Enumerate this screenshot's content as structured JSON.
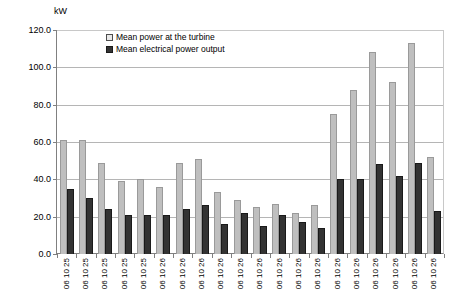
{
  "chart": {
    "y_unit_label": "kW",
    "legend": [
      {
        "label": "Mean power at the turbine",
        "swatch": "light",
        "color": "#BFBFBF"
      },
      {
        "label": "Mean electrical power output",
        "swatch": "dark",
        "color": "#333333"
      }
    ]
  },
  "chart_data": {
    "type": "bar",
    "title": "",
    "xlabel": "",
    "ylabel": "kW",
    "ylim": [
      0,
      120
    ],
    "ytick_values": [
      0,
      20,
      40,
      60,
      80,
      100,
      120
    ],
    "ytick_labels": [
      "0.0",
      "20.0",
      "40.0",
      "60.0",
      "80.0",
      "100.0",
      "120.0"
    ],
    "grid": true,
    "legend_position": "top-center-inside",
    "categories": [
      "06 10 25",
      "06 10 25",
      "06 10 25",
      "06 10 25",
      "06 10 25",
      "06 10 26",
      "06 10 26",
      "06 10 26",
      "06 10 26",
      "06 10 26",
      "06 10 26",
      "06 10 26",
      "06 10 26",
      "06 10 26",
      "06 10 26",
      "06 10 26",
      "06 10 26",
      "06 10 26",
      "06 10 26",
      "06 10 26"
    ],
    "series": [
      {
        "name": "Mean power at the turbine",
        "color": "#BFBFBF",
        "values": [
          61,
          61,
          49,
          39,
          40,
          36,
          49,
          51,
          33,
          29,
          25,
          27,
          22,
          26,
          75,
          88,
          108,
          92,
          113,
          52
        ]
      },
      {
        "name": "Mean electrical power output",
        "color": "#333333",
        "values": [
          35,
          30,
          24,
          21,
          21,
          21,
          24,
          26,
          16,
          22,
          15,
          21,
          17,
          14,
          40,
          40,
          48,
          42,
          49,
          23
        ]
      }
    ]
  }
}
